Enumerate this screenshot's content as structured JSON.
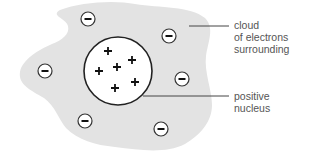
{
  "diagram": {
    "type": "atom-model",
    "colors": {
      "cloud": "#e3e3e3",
      "nucleus_fill": "#ffffff",
      "stroke": "#222222",
      "leader_line": "#444444",
      "label_text": "#555555"
    },
    "nucleus": {
      "charge_symbol": "+",
      "count": 6
    },
    "electrons": {
      "charge_symbol": "−",
      "count": 6
    },
    "labels": {
      "cloud": [
        "cloud",
        "of electrons",
        "surrounding"
      ],
      "nucleus": [
        "positive",
        "nucleus"
      ]
    }
  }
}
